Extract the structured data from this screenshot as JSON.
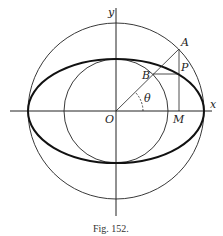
{
  "figure": {
    "caption": "Fig. 152.",
    "labels": {
      "y_axis": "y",
      "x_axis": "x",
      "origin": "O",
      "point_a": "A",
      "point_b": "B",
      "point_p": "P",
      "point_m": "M",
      "angle": "θ"
    },
    "colors": {
      "stroke": "#222222",
      "background": "#ffffff"
    }
  }
}
